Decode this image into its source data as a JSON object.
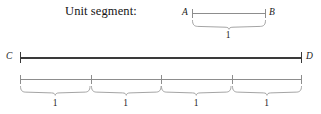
{
  "figure": {
    "caption": "Unit segment:",
    "unit_segment": {
      "start_label": "A",
      "end_label": "B",
      "measure_label": "1"
    },
    "long_segment": {
      "start_label": "C",
      "end_label": "D"
    },
    "subdivisions": {
      "count": 4,
      "labels": [
        "1",
        "1",
        "1",
        "1"
      ]
    }
  }
}
